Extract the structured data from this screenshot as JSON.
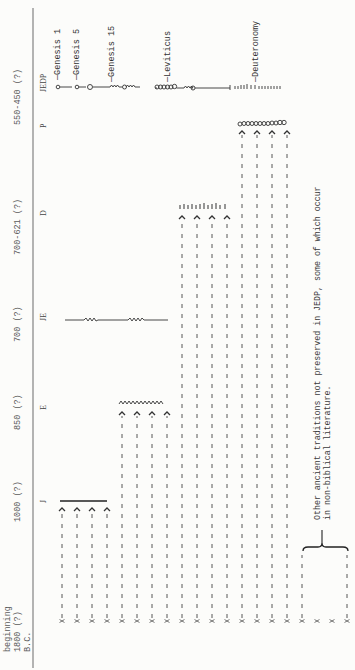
{
  "periods": [
    {
      "id": "p-jedp",
      "label": "550-450 (?)"
    },
    {
      "id": "p-p",
      "label": "700-621 (?)"
    },
    {
      "id": "p-d",
      "label": "700 (?)"
    },
    {
      "id": "p-je",
      "label": "850 (?)"
    },
    {
      "id": "p-e",
      "label": "1000 (?)"
    },
    {
      "id": "p-begin-1",
      "label": "beginning"
    },
    {
      "id": "p-begin-2",
      "label": "1800 (?)"
    },
    {
      "id": "p-begin-3",
      "label": "B.C."
    }
  ],
  "stages": {
    "j": "J",
    "e": "E",
    "je": "JE",
    "d": "D",
    "p": "P",
    "jedp": "JEDP"
  },
  "books": {
    "genesis1": "Genesis 1",
    "genesis5": "Genesis 5",
    "genesis15": "Genesis 15",
    "leviticus": "Leviticus",
    "deuteronomy": "Deuteronomy"
  },
  "note": {
    "line1": "Other ancient traditions not preserved in JEDP, some of which occur",
    "line2": "in non-biblical literature."
  },
  "sources": {
    "count": 20,
    "origin_marker": "X",
    "groups": [
      {
        "name": "J",
        "columns": [
          0,
          1,
          2,
          3
        ],
        "symbol": "solid-line"
      },
      {
        "name": "E",
        "columns": [
          4,
          5,
          6,
          7
        ],
        "symbol": "zigzag"
      },
      {
        "name": "D",
        "columns": [
          8,
          9,
          10,
          11
        ],
        "symbol": "tick-marks"
      },
      {
        "name": "P",
        "columns": [
          12,
          13,
          14,
          15
        ],
        "symbol": "circles"
      },
      {
        "name": "Other",
        "columns": [
          16,
          17,
          18,
          19
        ],
        "symbol": "none"
      }
    ]
  },
  "colors": {
    "ink": "#333333",
    "paper": "#fcfcfa",
    "rule": "#6a6a6a"
  }
}
